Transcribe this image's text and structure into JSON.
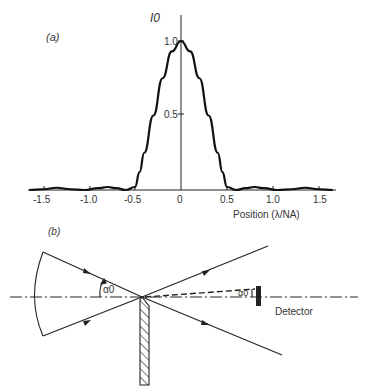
{
  "chart_data": {
    "type": "line",
    "panel_label": "(a)",
    "title": "",
    "xlabel": "Position (λ/NA)",
    "ylabel": "I0",
    "xlim": [
      -1.65,
      1.65
    ],
    "ylim": [
      0,
      1.05
    ],
    "x_ticks": [
      "-1.5",
      "-1.0",
      "-0.5",
      "0",
      "0.5",
      "1.0",
      "1.5"
    ],
    "y_ticks": [
      "0.5",
      "1.0"
    ],
    "grid": false,
    "legend": null,
    "series": [
      {
        "name": "Intensity profile",
        "x": [
          -1.65,
          -1.5,
          -1.35,
          -1.2,
          -1.05,
          -0.9,
          -0.8,
          -0.7,
          -0.6,
          -0.5,
          -0.45,
          -0.4,
          -0.3,
          -0.2,
          -0.1,
          0.0,
          0.1,
          0.2,
          0.3,
          0.4,
          0.45,
          0.5,
          0.6,
          0.7,
          0.8,
          0.9,
          1.05,
          1.2,
          1.35,
          1.5,
          1.65
        ],
        "values": [
          0.0,
          0.005,
          0.015,
          0.005,
          0.0,
          0.012,
          0.02,
          0.012,
          0.0,
          0.02,
          0.12,
          0.25,
          0.5,
          0.75,
          0.93,
          1.0,
          0.93,
          0.75,
          0.5,
          0.25,
          0.12,
          0.02,
          0.0,
          0.012,
          0.02,
          0.012,
          0.0,
          0.005,
          0.015,
          0.005,
          0.0
        ]
      }
    ]
  },
  "diagram": {
    "panel_label": "(b)",
    "angle_label_incident": "α0",
    "angle_label_detector": "α0",
    "detector_label": "Detector"
  }
}
